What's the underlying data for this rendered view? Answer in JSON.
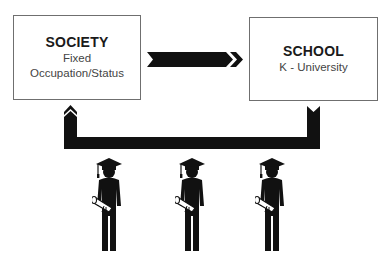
{
  "diagram": {
    "society": {
      "title": "SOCIETY",
      "line1": "Fixed",
      "line2": "Occupation/Status"
    },
    "school": {
      "title": "SCHOOL",
      "line1": "K - University"
    },
    "arrow_direction": "society-to-school",
    "return_path": "school-to-society",
    "graduates_count": 3,
    "colors": {
      "arrow": "#111111",
      "box_border": "#6f6f6f",
      "text_dark": "#1a1a1a",
      "text_sub": "#444444"
    },
    "icons": [
      "arrow-right-icon",
      "return-arrow-icon",
      "graduate-icon",
      "graduate-icon",
      "graduate-icon"
    ]
  }
}
